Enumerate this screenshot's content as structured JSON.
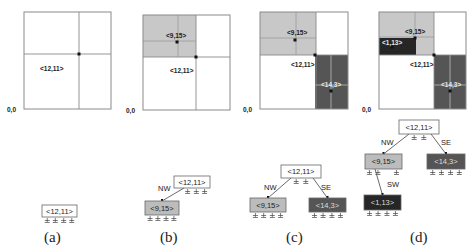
{
  "panels": [
    {
      "caption": "(a)",
      "origin_label": "0,0",
      "grid": {
        "x": 24,
        "y": 12,
        "w": 87,
        "h": 97,
        "vx": 79,
        "hy": 54
      },
      "regions": [],
      "points": [
        {
          "label": "<12,11>",
          "x": 79,
          "y": 54,
          "lx": 40,
          "ly": 66
        }
      ],
      "tree": {
        "nodes": [
          {
            "id": "n1",
            "label": "<12,11>",
            "x": 42,
            "y": 205,
            "w": 35,
            "h": 12,
            "fill": "#ffffff",
            "text": "#222222",
            "nulls": 4
          }
        ],
        "edges": []
      }
    },
    {
      "caption": "(b)",
      "origin_label": "0,0",
      "grid": {
        "x": 143,
        "y": 15,
        "w": 87,
        "h": 95,
        "vx": 196,
        "hy": 57
      },
      "regions": [
        {
          "x": 143,
          "y": 15,
          "w": 53,
          "h": 42,
          "fill": "#c8c8c8",
          "vx": 178,
          "hy": 41
        }
      ],
      "points": [
        {
          "label": "<9,15>",
          "x": 177,
          "y": 42,
          "lx": 166,
          "ly": 33
        },
        {
          "label": "<12,11>",
          "x": 196,
          "y": 57,
          "lx": 170,
          "ly": 68
        }
      ],
      "tree": {
        "nodes": [
          {
            "id": "n1",
            "label": "<12,11>",
            "x": 174,
            "y": 176,
            "w": 36,
            "h": 12,
            "fill": "#ffffff",
            "text": "#222222",
            "nulls": 3
          },
          {
            "id": "n2",
            "label": "<9,15>",
            "x": 145,
            "y": 201,
            "w": 34,
            "h": 14,
            "fill": "#bcbcbc",
            "text": "#222222",
            "nulls": 4
          }
        ],
        "edges": [
          {
            "from": "n1",
            "to": "n2",
            "label": "NW",
            "lx": 158,
            "ly": 191
          }
        ]
      }
    },
    {
      "caption": "(c)",
      "origin_label": "0,0",
      "grid": {
        "x": 260,
        "y": 12,
        "w": 88,
        "h": 97,
        "vx": 316,
        "hy": 55
      },
      "regions": [
        {
          "x": 260,
          "y": 12,
          "w": 56,
          "h": 43,
          "fill": "#c8c8c8",
          "vx": 296,
          "hy": 38
        },
        {
          "x": 315,
          "y": 55,
          "w": 33,
          "h": 54,
          "fill": "#555555",
          "vx": 331,
          "hy": 85
        }
      ],
      "points": [
        {
          "label": "<9,15>",
          "x": 295,
          "y": 40,
          "lx": 287,
          "ly": 30
        },
        {
          "label": "<12,11>",
          "x": 315,
          "y": 55,
          "lx": 291,
          "ly": 62
        },
        {
          "label": "<14,3>",
          "x": 331,
          "y": 91,
          "lx": 321,
          "ly": 82
        }
      ],
      "tree": {
        "nodes": [
          {
            "id": "n1",
            "label": "<12,11>",
            "x": 281,
            "y": 165,
            "w": 40,
            "h": 13,
            "fill": "#ffffff",
            "text": "#222222",
            "nulls": 2
          },
          {
            "id": "n2",
            "label": "<9,15>",
            "x": 250,
            "y": 198,
            "w": 36,
            "h": 14,
            "fill": "#bcbcbc",
            "text": "#222222",
            "nulls": 4
          },
          {
            "id": "n3",
            "label": "<14,3>",
            "x": 309,
            "y": 198,
            "w": 37,
            "h": 14,
            "fill": "#555555",
            "text": "#dddddd",
            "nulls": 4
          }
        ],
        "edges": [
          {
            "from": "n1",
            "to": "n2",
            "label": "NW",
            "lx": 264,
            "ly": 190
          },
          {
            "from": "n1",
            "to": "n3",
            "label": "SE",
            "lx": 321,
            "ly": 190
          }
        ]
      }
    },
    {
      "caption": "(d)",
      "origin_label": "0,0",
      "grid": {
        "x": 379,
        "y": 12,
        "w": 87,
        "h": 97,
        "vx": 434,
        "hy": 55
      },
      "regions": [
        {
          "x": 379,
          "y": 12,
          "w": 55,
          "h": 43,
          "fill": "#c8c8c8",
          "vx": 415,
          "hy": 37
        },
        {
          "x": 379,
          "y": 38,
          "w": 37,
          "h": 17,
          "fill": "#262626",
          "vx": 0,
          "hy": 0
        },
        {
          "x": 434,
          "y": 55,
          "w": 32,
          "h": 54,
          "fill": "#555555",
          "vx": 450,
          "hy": 85
        }
      ],
      "points": [
        {
          "label": "<9,15>",
          "x": 415,
          "y": 38,
          "lx": 405,
          "ly": 29
        },
        {
          "label": "<1,13>",
          "x": 392,
          "y": 47,
          "lx": 382,
          "ly": 40
        },
        {
          "label": "<12,11>",
          "x": 434,
          "y": 55,
          "lx": 410,
          "ly": 62
        },
        {
          "label": "<14,3>",
          "x": 450,
          "y": 91,
          "lx": 441,
          "ly": 82
        }
      ],
      "tree": {
        "nodes": [
          {
            "id": "n1",
            "label": "<12,11>",
            "x": 399,
            "y": 120,
            "w": 40,
            "h": 14,
            "fill": "#ffffff",
            "text": "#222222",
            "nulls": 2
          },
          {
            "id": "n2",
            "label": "<9,15>",
            "x": 365,
            "y": 154,
            "w": 37,
            "h": 15,
            "fill": "#bcbcbc",
            "text": "#222222",
            "nulls": 3
          },
          {
            "id": "n3",
            "label": "<14,3>",
            "x": 427,
            "y": 154,
            "w": 38,
            "h": 15,
            "fill": "#555555",
            "text": "#dddddd",
            "nulls": 4
          },
          {
            "id": "n4",
            "label": "<1,13>",
            "x": 364,
            "y": 195,
            "w": 37,
            "h": 15,
            "fill": "#262626",
            "text": "#dddddd",
            "nulls": 4
          }
        ],
        "edges": [
          {
            "from": "n1",
            "to": "n2",
            "label": "NW",
            "lx": 381,
            "ly": 145
          },
          {
            "from": "n1",
            "to": "n3",
            "label": "SE",
            "lx": 441,
            "ly": 145
          },
          {
            "from": "n2",
            "to": "n4",
            "label": "SW",
            "lx": 387,
            "ly": 187
          }
        ]
      }
    }
  ],
  "captions": {
    "a": "(a)",
    "b": "(b)",
    "c": "(c)",
    "d": "(d)"
  },
  "colors": {
    "border": "#8a8a8a",
    "light_region": "#c8c8c8",
    "mid_region": "#555555",
    "dark_region": "#262626",
    "text": "#222222"
  }
}
